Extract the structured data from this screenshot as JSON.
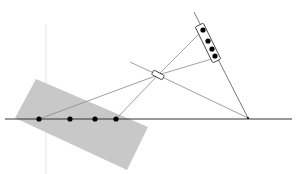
{
  "diagram": {
    "title": "",
    "colors": {
      "background": "#ffffff",
      "shaded_region": "#c8c8c8",
      "axis_line": "#333333",
      "ray_line": "#888888",
      "dot": "#000000",
      "guide_line": "#e6e6e6"
    },
    "axis": {
      "x1": 5,
      "y1": 119,
      "x2": 292,
      "y2": 119
    },
    "shaded_region": {
      "points": "36,79 148,127 127,170 15,118"
    },
    "guide_vertical": {
      "x": 46,
      "y1": 24,
      "y2": 174
    },
    "object_points": [
      {
        "x": 39,
        "y": 119
      },
      {
        "x": 70,
        "y": 119
      },
      {
        "x": 95,
        "y": 119
      },
      {
        "x": 116,
        "y": 119
      }
    ],
    "focal_point": {
      "x": 248,
      "y": 118
    },
    "lens": {
      "cx": 158,
      "cy": 75,
      "w": 12,
      "h": 5,
      "angle": 28
    },
    "sensor_axis": {
      "x1": 194,
      "y1": 12,
      "x2": 248,
      "y2": 118
    },
    "sensor": {
      "cx": 208,
      "cy": 43,
      "w": 9,
      "h": 40,
      "angle": -26
    },
    "image_points": [
      {
        "x": 203,
        "y": 30
      },
      {
        "x": 208,
        "y": 41
      },
      {
        "x": 212,
        "y": 49
      },
      {
        "x": 215,
        "y": 56
      }
    ],
    "rays": [
      {
        "x1": 39,
        "y1": 119,
        "x2": 158,
        "y2": 75
      },
      {
        "x1": 116,
        "y1": 119,
        "x2": 158,
        "y2": 75
      },
      {
        "x1": 158,
        "y1": 75,
        "x2": 200,
        "y2": 33
      },
      {
        "x1": 158,
        "y1": 75,
        "x2": 215,
        "y2": 58
      },
      {
        "x1": 158,
        "y1": 75,
        "x2": 248,
        "y2": 118
      },
      {
        "x1": 158,
        "y1": 75,
        "x2": 130,
        "y2": 62
      }
    ]
  }
}
